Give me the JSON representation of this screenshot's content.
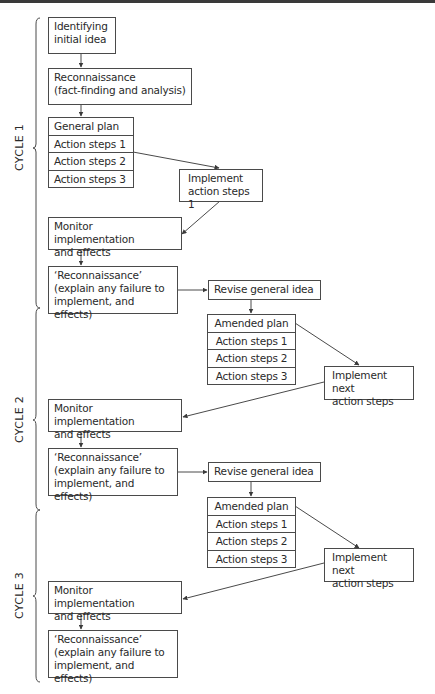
{
  "diagram": {
    "type": "flowchart",
    "cycles": [
      {
        "label": "CYCLE 1"
      },
      {
        "label": "CYCLE 2"
      },
      {
        "label": "CYCLE 3"
      }
    ],
    "cycle1": {
      "identify": [
        "Identifying",
        "initial idea"
      ],
      "recon": [
        "Reconnaissance",
        "(fact-finding and analysis)"
      ],
      "plan": [
        "General plan",
        "Action steps 1",
        "Action steps 2",
        "Action steps 3"
      ],
      "implement": [
        "Implement",
        "action steps 1"
      ],
      "monitor": [
        "Monitor implementation",
        "and effects"
      ],
      "recon2": [
        "‘Reconnaissance’",
        "(explain any failure to",
        "implement, and effects)"
      ],
      "revise": "Revise general idea"
    },
    "cycle2": {
      "plan": [
        "Amended plan",
        "Action steps 1",
        "Action steps 2",
        "Action steps 3"
      ],
      "implement": [
        "Implement next",
        "action steps"
      ],
      "monitor": [
        "Monitor implementation",
        "and effects"
      ],
      "recon": [
        "‘Reconnaissance’",
        "(explain any failure to",
        "implement, and effects)"
      ],
      "revise": "Revise general idea"
    },
    "cycle3": {
      "plan": [
        "Amended plan",
        "Action steps 1",
        "Action steps 2",
        "Action steps 3"
      ],
      "implement": [
        "Implement next",
        "action steps"
      ],
      "monitor": [
        "Monitor implementation",
        "and effects"
      ],
      "recon": [
        "‘Reconnaissance’",
        "(explain any failure to",
        "implement, and effects)"
      ]
    },
    "colors": {
      "line": "#4a4a4a",
      "text": "#2a2a2a",
      "background": "#ffffff"
    }
  }
}
